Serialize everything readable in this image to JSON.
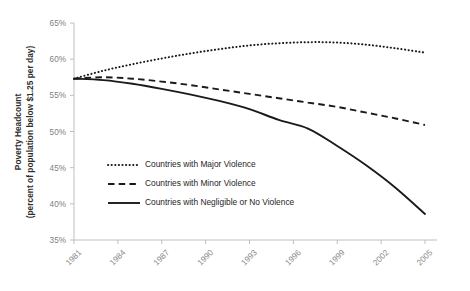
{
  "chart_data": {
    "type": "line",
    "title": "",
    "xlabel": "",
    "ylabel": "Poverty Headcount",
    "ylabel_line1": "Poverty Headcount",
    "ylabel_line2": "(percent of population below $1.25 per day)",
    "grid": false,
    "legend_position": "center-left-inside",
    "ylim": [
      35,
      65
    ],
    "ytick_step": 5,
    "ytick_labels": [
      "65%",
      "60%",
      "55%",
      "50%",
      "45%",
      "40%",
      "35%"
    ],
    "ytick_values": [
      65,
      60,
      55,
      50,
      45,
      40,
      35
    ],
    "xlim": [
      1981,
      2005
    ],
    "xtick_labels": [
      "1981",
      "1984",
      "1987",
      "1990",
      "1993",
      "1996",
      "1999",
      "2002",
      "2005"
    ],
    "xtick_values": [
      1981,
      1984,
      1987,
      1990,
      1993,
      1996,
      1999,
      2002,
      2005
    ],
    "x": [
      1981,
      1983,
      1985,
      1987,
      1989,
      1991,
      1993,
      1995,
      1997,
      1999,
      2001,
      2003,
      2005
    ],
    "series": [
      {
        "name": "Countries with Major Violence",
        "style": "dotted",
        "values": [
          57.3,
          58.4,
          59.3,
          60.1,
          60.8,
          61.4,
          61.9,
          62.2,
          62.35,
          62.3,
          62.0,
          61.5,
          60.9
        ]
      },
      {
        "name": "Countries with Minor Violence",
        "style": "dashed",
        "values": [
          57.3,
          57.5,
          57.3,
          56.9,
          56.4,
          55.8,
          55.2,
          54.6,
          54.0,
          53.4,
          52.6,
          51.8,
          50.9
        ]
      },
      {
        "name": "Countries with Negligible or No Violence",
        "style": "solid",
        "values": [
          57.3,
          57.1,
          56.6,
          55.9,
          55.1,
          54.2,
          53.1,
          51.6,
          50.4,
          48.0,
          45.3,
          42.2,
          38.6
        ]
      }
    ],
    "legend": [
      {
        "label": "Countries with Major Violence",
        "style": "dotted"
      },
      {
        "label": "Countries with Minor Violence",
        "style": "dashed"
      },
      {
        "label": "Countries with Negligible or No Violence",
        "style": "solid"
      }
    ],
    "colors": {
      "series_line": "#1a1a1a",
      "axis": "#bfbfbf",
      "tick_label": "#808080",
      "axis_title": "#2e2e2e",
      "background": "#ffffff"
    }
  }
}
